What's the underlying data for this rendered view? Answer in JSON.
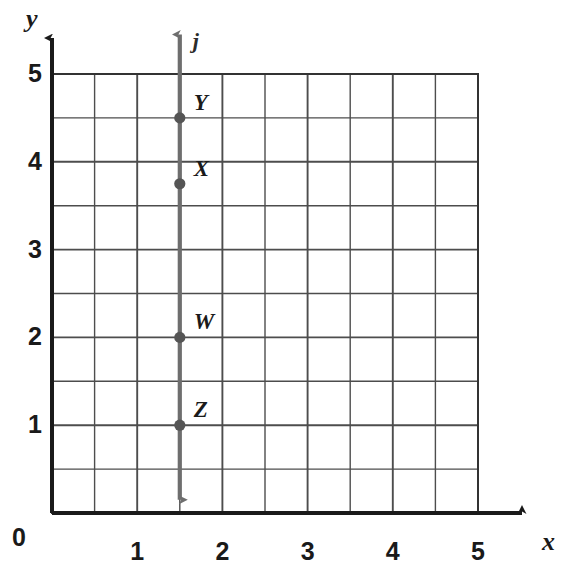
{
  "chart_data": {
    "type": "scatter",
    "title": "",
    "xlabel": "x",
    "ylabel": "y",
    "xlim": [
      0,
      5
    ],
    "ylim": [
      0,
      5
    ],
    "grid": true,
    "grid_step": 0.5,
    "major_step": 1,
    "legend": "none",
    "x_ticks": [
      "1",
      "2",
      "3",
      "4",
      "5"
    ],
    "x_tick_values": [
      1,
      2,
      3,
      4,
      5
    ],
    "y_ticks": [
      "0",
      "1",
      "2",
      "3",
      "4",
      "5"
    ],
    "y_tick_values": [
      0,
      1,
      2,
      3,
      4,
      5
    ],
    "origin_label": "0",
    "lines": [
      {
        "name": "j",
        "orientation": "vertical",
        "x": 1.5,
        "y_from": 0.15,
        "y_to": 5.45,
        "arrow_start": true,
        "arrow_end": true,
        "color": "#6e6e6e"
      }
    ],
    "points": [
      {
        "label": "Y",
        "x": 1.5,
        "y": 4.5
      },
      {
        "label": "X",
        "x": 1.5,
        "y": 3.75
      },
      {
        "label": "W",
        "x": 1.5,
        "y": 2
      },
      {
        "label": "Z",
        "x": 1.5,
        "y": 1
      }
    ],
    "point_color": "#555555",
    "axis_color": "#1a1a1a",
    "grid_color": "#4d4d4d"
  }
}
